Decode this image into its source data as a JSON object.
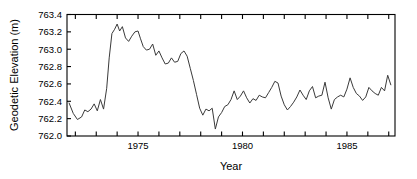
{
  "chart_data": {
    "type": "line",
    "title": "",
    "xlabel": "Year",
    "ylabel": "Geodetic Elevation (m)",
    "xlim": [
      1971.6,
      1987.3
    ],
    "ylim": [
      762.0,
      763.4
    ],
    "xticks": [
      1975,
      1980,
      1985
    ],
    "xtick_labels": [
      "1975",
      "1980",
      "1985"
    ],
    "xminor_tick_step": 1,
    "yticks": [
      762.0,
      762.2,
      762.4,
      762.6,
      762.8,
      763.0,
      763.2,
      763.4
    ],
    "ytick_labels": [
      "762.0",
      "762.2",
      "762.4",
      "762.6",
      "762.8",
      "763.0",
      "763.2",
      "763.4"
    ],
    "grid": false,
    "legend": null,
    "line_color": "#3a3a3a",
    "frame_color": "#000000",
    "series": [
      {
        "name": "Geodetic Elevation",
        "x": [
          1971.7,
          1971.9,
          1972.1,
          1972.3,
          1972.45,
          1972.6,
          1972.75,
          1972.9,
          1973.05,
          1973.2,
          1973.35,
          1973.5,
          1973.62,
          1973.75,
          1973.88,
          1974.0,
          1974.12,
          1974.25,
          1974.4,
          1974.55,
          1974.7,
          1974.85,
          1975.0,
          1975.12,
          1975.25,
          1975.4,
          1975.55,
          1975.7,
          1975.85,
          1976.0,
          1976.15,
          1976.3,
          1976.45,
          1976.6,
          1976.75,
          1976.9,
          1977.05,
          1977.2,
          1977.35,
          1977.5,
          1977.65,
          1977.8,
          1977.95,
          1978.1,
          1978.25,
          1978.4,
          1978.55,
          1978.7,
          1978.85,
          1979.0,
          1979.15,
          1979.3,
          1979.45,
          1979.6,
          1979.75,
          1979.9,
          1980.05,
          1980.2,
          1980.35,
          1980.5,
          1980.65,
          1980.8,
          1980.95,
          1981.1,
          1981.25,
          1981.4,
          1981.55,
          1981.7,
          1981.85,
          1982.0,
          1982.15,
          1982.3,
          1982.45,
          1982.6,
          1982.75,
          1982.9,
          1983.05,
          1983.2,
          1983.35,
          1983.5,
          1983.65,
          1983.8,
          1983.95,
          1984.1,
          1984.25,
          1984.4,
          1984.55,
          1984.7,
          1984.85,
          1985.0,
          1985.15,
          1985.3,
          1985.45,
          1985.6,
          1985.75,
          1985.9,
          1986.05,
          1986.2,
          1986.35,
          1986.5,
          1986.65,
          1986.8,
          1986.95,
          1987.1
        ],
        "values": [
          762.38,
          762.26,
          762.19,
          762.22,
          762.3,
          762.28,
          762.31,
          762.37,
          762.29,
          762.42,
          762.31,
          762.55,
          762.9,
          763.18,
          763.23,
          763.29,
          763.21,
          763.26,
          763.13,
          763.09,
          763.15,
          763.2,
          763.21,
          763.12,
          763.03,
          762.99,
          763.0,
          763.06,
          762.93,
          762.98,
          762.9,
          762.83,
          762.84,
          762.9,
          762.85,
          762.86,
          762.95,
          762.98,
          762.92,
          762.78,
          762.64,
          762.48,
          762.32,
          762.24,
          762.31,
          762.29,
          762.32,
          762.08,
          762.22,
          762.27,
          762.34,
          762.36,
          762.42,
          762.52,
          762.42,
          762.46,
          762.52,
          762.44,
          762.38,
          762.43,
          762.41,
          762.47,
          762.45,
          762.44,
          762.5,
          762.56,
          762.63,
          762.61,
          762.46,
          762.36,
          762.3,
          762.34,
          762.39,
          762.45,
          762.53,
          762.47,
          762.42,
          762.52,
          762.57,
          762.44,
          762.46,
          762.47,
          762.62,
          762.44,
          762.31,
          762.42,
          762.45,
          762.47,
          762.45,
          762.54,
          762.67,
          762.56,
          762.49,
          762.46,
          762.41,
          762.45,
          762.56,
          762.52,
          762.49,
          762.47,
          762.56,
          762.52,
          762.7,
          762.59
        ]
      }
    ]
  }
}
